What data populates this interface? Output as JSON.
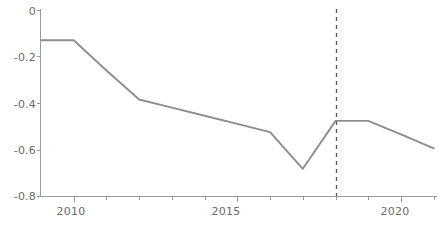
{
  "chart_data": {
    "type": "line",
    "title": "",
    "subtitle": "",
    "xlabel": "",
    "ylabel": "",
    "xlim": [
      2009,
      2021.1
    ],
    "ylim": [
      -0.8,
      0.0
    ],
    "grid": false,
    "legend": null,
    "y_ticks": [
      0,
      -0.2,
      -0.4,
      -0.6,
      -0.8
    ],
    "y_tick_labels": [
      "0",
      "-0.2",
      "-0.4",
      "-0.6",
      "-0.8"
    ],
    "x_ticks": [
      2010,
      2011,
      2012,
      2013,
      2014,
      2015,
      2016,
      2017,
      2018,
      2019,
      2020,
      2021
    ],
    "x_tick_labels_shown": [
      "2010",
      "2015",
      "2020"
    ],
    "x_labeled_ticks": [
      2010,
      2015,
      2020
    ],
    "series": [
      {
        "name": "series-1",
        "color": "#8e8e8e",
        "x": [
          2009,
          2010,
          2011,
          2012,
          2013,
          2014,
          2015,
          2016,
          2017,
          2018,
          2019,
          2020,
          2021
        ],
        "values": [
          -0.13,
          -0.13,
          -0.26,
          -0.385,
          -0.42,
          -0.455,
          -0.49,
          -0.525,
          -0.683,
          -0.477,
          -0.477,
          -0.535,
          -0.595
        ]
      }
    ],
    "annotations": [
      {
        "type": "vertical-dashed-line",
        "name": "reference-line-2018",
        "x": 2018,
        "color": "#555555",
        "dash": "4,4",
        "label": ""
      }
    ],
    "axis_color": "#9a9a9a",
    "tick_color": "#9a9a9a",
    "label_color": "#6b6b6b",
    "background": "#ffffff"
  }
}
